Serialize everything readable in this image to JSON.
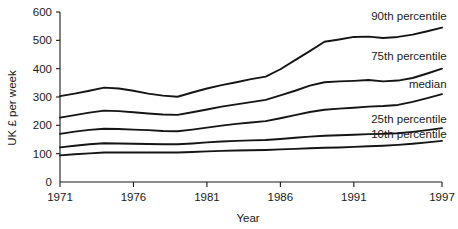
{
  "chart_data": {
    "type": "line",
    "title": "",
    "xlabel": "Year",
    "ylabel": "UK £ per week",
    "xlim": [
      1971,
      1997
    ],
    "ylim": [
      0,
      600
    ],
    "grid": false,
    "legend_position": "inline-right",
    "xticks": [
      "1971",
      "1976",
      "1981",
      "1986",
      "1991",
      "1997"
    ],
    "xtick_values": [
      1971,
      1976,
      1981,
      1986,
      1991,
      1997
    ],
    "yticks": [
      "0",
      "100",
      "200",
      "300",
      "400",
      "500",
      "600"
    ],
    "ytick_values": [
      0,
      100,
      200,
      300,
      400,
      500,
      600
    ],
    "x": [
      1971,
      1972,
      1973,
      1974,
      1975,
      1976,
      1977,
      1978,
      1979,
      1980,
      1981,
      1982,
      1983,
      1984,
      1985,
      1986,
      1987,
      1988,
      1989,
      1990,
      1991,
      1992,
      1993,
      1994,
      1995,
      1996,
      1997
    ],
    "series": [
      {
        "name": "90th percentile",
        "label": "90th percentile",
        "values": [
          303,
          312,
          322,
          333,
          330,
          322,
          312,
          305,
          301,
          316,
          330,
          342,
          352,
          363,
          372,
          398,
          430,
          462,
          495,
          503,
          512,
          513,
          508,
          512,
          520,
          532,
          545
        ]
      },
      {
        "name": "75th percentile",
        "label": "75th percentile",
        "values": [
          227,
          236,
          245,
          252,
          250,
          246,
          242,
          238,
          237,
          246,
          256,
          266,
          274,
          282,
          290,
          306,
          322,
          340,
          352,
          355,
          357,
          360,
          355,
          358,
          367,
          383,
          400
        ]
      },
      {
        "name": "median",
        "label": "median",
        "values": [
          170,
          178,
          184,
          188,
          187,
          185,
          183,
          180,
          179,
          185,
          192,
          199,
          205,
          210,
          215,
          225,
          236,
          247,
          255,
          259,
          262,
          266,
          268,
          272,
          283,
          296,
          310
        ]
      },
      {
        "name": "25th percentile",
        "label": "25th percentile",
        "values": [
          122,
          128,
          133,
          137,
          136,
          135,
          134,
          133,
          133,
          136,
          140,
          143,
          145,
          147,
          148,
          152,
          156,
          160,
          163,
          165,
          167,
          169,
          170,
          172,
          177,
          183,
          190
        ]
      },
      {
        "name": "10th percentile",
        "label": "10th percentile",
        "values": [
          94,
          98,
          101,
          104,
          104,
          104,
          104,
          104,
          104,
          106,
          108,
          110,
          111,
          112,
          113,
          115,
          117,
          119,
          121,
          122,
          124,
          126,
          128,
          131,
          135,
          140,
          145
        ]
      }
    ],
    "series_label_anchor": [
      {
        "name": "90th percentile",
        "x": 1995.0,
        "y": 587
      },
      {
        "name": "75th percentile",
        "x": 1995.0,
        "y": 445
      },
      {
        "name": "median",
        "x": 1995.0,
        "y": 345
      },
      {
        "name": "25th percentile",
        "x": 1995.0,
        "y": 223
      },
      {
        "name": "10th percentile",
        "x": 1995.0,
        "y": 168
      }
    ],
    "colors": {
      "line": "#151515",
      "axis": "#1a1a1a",
      "background": "#ffffff"
    }
  }
}
